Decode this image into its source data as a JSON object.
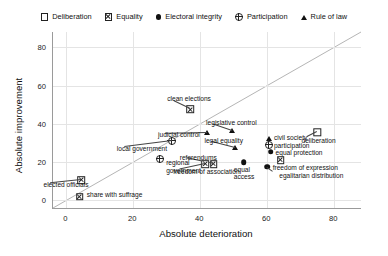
{
  "chart_data": {
    "type": "scatter",
    "title": "",
    "xlabel": "Absolute deterioration",
    "ylabel": "Absolute improvement",
    "xlim": [
      -4,
      88
    ],
    "ylim": [
      -4,
      88
    ],
    "xticks": [
      0,
      20,
      40,
      60,
      80
    ],
    "yticks": [
      0,
      20,
      40,
      60,
      80
    ],
    "grid": true,
    "legend_position": "top",
    "reference_line": {
      "type": "identity",
      "label": "y = x"
    },
    "series": [
      {
        "name": "Deliberation",
        "marker": "open-square"
      },
      {
        "name": "Equality",
        "marker": "square-with-x"
      },
      {
        "name": "Electoral integrity",
        "marker": "filled-circle"
      },
      {
        "name": "Participation",
        "marker": "circle-with-cross"
      },
      {
        "name": "Rule of law",
        "marker": "filled-triangle"
      }
    ],
    "points": [
      {
        "label": "elected officials",
        "series": "Equality",
        "x": 4.5,
        "y": 10.5,
        "lx": -38,
        "ly": 4,
        "align": "right"
      },
      {
        "label": "share with suffrage",
        "series": "Equality",
        "x": 4.0,
        "y": 2.0,
        "lx": 7,
        "ly": -3,
        "align": "left"
      },
      {
        "label": "local government",
        "series": "Participation",
        "x": 31.5,
        "y": 31.0,
        "lx": -55,
        "ly": 7,
        "align": "left"
      },
      {
        "label": "regional\ngovernment",
        "series": "Participation",
        "x": 28.0,
        "y": 21.5,
        "lx": 6,
        "ly": 3,
        "align": "left"
      },
      {
        "label": "clean elections",
        "series": "Equality",
        "x": 37.0,
        "y": 47.5,
        "lx": -23,
        "ly": -11,
        "align": "left"
      },
      {
        "label": "judicial control",
        "series": "Rule of law",
        "x": 42.0,
        "y": 35.0,
        "lx": -49,
        "ly": 1,
        "align": "left"
      },
      {
        "label": "legislative control",
        "series": "Rule of law",
        "x": 49.5,
        "y": 36.5,
        "lx": -26,
        "ly": -9,
        "align": "left"
      },
      {
        "label": "legal equality",
        "series": "Rule of law",
        "x": 50.5,
        "y": 27.5,
        "lx": -31,
        "ly": -8,
        "align": "left"
      },
      {
        "label": "referendums",
        "series": "Equality",
        "x": 44.0,
        "y": 19.0,
        "lx": -34,
        "ly": -7,
        "align": "left"
      },
      {
        "label": "freedom of association",
        "series": "Equality",
        "x": 41.5,
        "y": 19.0,
        "lx": -32,
        "ly": 7,
        "align": "left"
      },
      {
        "label": "equal\naccess",
        "series": "Electoral integrity",
        "x": 53.0,
        "y": 20.0,
        "lx": -10,
        "ly": 7,
        "align": "left"
      },
      {
        "label": "civil society",
        "series": "Rule of law",
        "x": 60.5,
        "y": 32.0,
        "lx": 5,
        "ly": -2,
        "align": "left"
      },
      {
        "label": "participation",
        "series": "Participation",
        "x": 60.5,
        "y": 29.0,
        "lx": 5,
        "ly": 0,
        "align": "left"
      },
      {
        "label": "equal protection",
        "series": "Electoral integrity",
        "x": 61.0,
        "y": 25.5,
        "lx": 5,
        "ly": 0,
        "align": "left"
      },
      {
        "label": "freedom of expression",
        "series": "Equality",
        "x": 64.0,
        "y": 21.0,
        "lx": -8,
        "ly": 7,
        "align": "left"
      },
      {
        "label": "egalitarian distribution",
        "series": "Electoral integrity",
        "x": 60.0,
        "y": 17.5,
        "lx": 12,
        "ly": 8,
        "align": "left"
      },
      {
        "label": "deliberation",
        "series": "Deliberation",
        "x": 75.0,
        "y": 35.5,
        "lx": -16,
        "ly": 8,
        "align": "left"
      }
    ]
  },
  "legend": {
    "items": [
      {
        "label": "Deliberation",
        "marker": "open-square-icon"
      },
      {
        "label": "Equality",
        "marker": "square-with-x-icon"
      },
      {
        "label": "Electoral integrity",
        "marker": "filled-circle-icon"
      },
      {
        "label": "Participation",
        "marker": "circle-with-cross-icon"
      },
      {
        "label": "Rule of law",
        "marker": "filled-triangle-icon"
      }
    ]
  }
}
